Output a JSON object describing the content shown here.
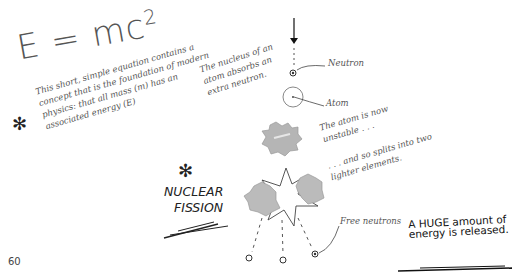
{
  "equation": {
    "base": "E = mc",
    "exponent": "2",
    "note": "This short, simple equation contains a concept that is the foundation of modern physics: that all mass (m) has an associated energy (E)"
  },
  "diagram": {
    "nucleus_note": "The nucleus of an atom absorbs an extra neutron.",
    "neutron_label": "Neutron",
    "atom_label": "Atom",
    "unstable_note": "The atom is now unstable . . .",
    "splits_note": ". . . and so splits into two lighter elements.",
    "free_neutrons_label": "Free neutrons"
  },
  "title": {
    "line1": "NUCLEAR",
    "line2": "FISSION"
  },
  "energy_note": {
    "line1": "A HUGE amount of",
    "line2": "energy is released."
  },
  "page_number": "60",
  "colors": {
    "ink": "#333333",
    "pencil": "#555555",
    "nucleus_gray": "#aaaaaa"
  }
}
